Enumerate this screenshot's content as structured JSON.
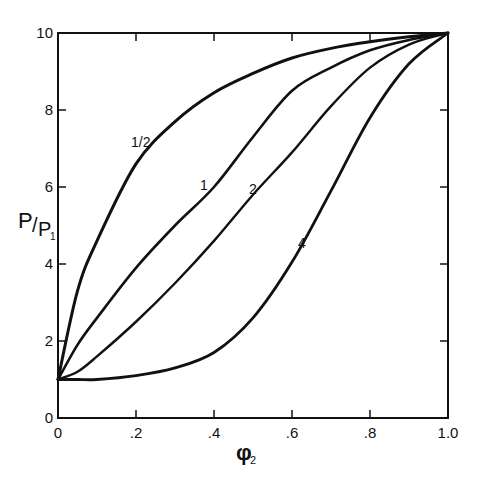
{
  "chart_data": {
    "type": "line",
    "title": "",
    "xlabel": "φ2",
    "ylabel": "P/P1",
    "xlim": [
      0,
      1.0
    ],
    "ylim": [
      0,
      10
    ],
    "grid": false,
    "legend": "inline curve labels",
    "x_ticks": [
      "0",
      ".2",
      ".4",
      ".6",
      ".8",
      "1.0"
    ],
    "y_ticks": [
      "0",
      "2",
      "4",
      "6",
      "8",
      "10"
    ],
    "x": [
      0,
      0.05,
      0.1,
      0.2,
      0.3,
      0.4,
      0.5,
      0.6,
      0.7,
      0.8,
      0.9,
      1.0
    ],
    "series": [
      {
        "name": "1/2",
        "label": "1/2",
        "values": [
          1.0,
          3.3,
          4.6,
          6.6,
          7.7,
          8.45,
          8.95,
          9.35,
          9.6,
          9.77,
          9.9,
          10.0
        ]
      },
      {
        "name": "1",
        "label": "1",
        "values": [
          1.0,
          1.9,
          2.6,
          3.9,
          5.0,
          6.0,
          7.3,
          8.5,
          9.1,
          9.55,
          9.82,
          10.0
        ]
      },
      {
        "name": "2",
        "label": "2",
        "values": [
          1.0,
          1.2,
          1.6,
          2.5,
          3.5,
          4.6,
          5.8,
          6.9,
          8.1,
          9.1,
          9.7,
          10.0
        ]
      },
      {
        "name": "4",
        "label": "4",
        "values": [
          1.0,
          1.0,
          1.0,
          1.1,
          1.3,
          1.7,
          2.6,
          4.05,
          5.9,
          7.8,
          9.2,
          10.0
        ]
      }
    ]
  },
  "axes": {
    "ylabel_main": "P",
    "ylabel_slash": "/",
    "ylabel_sub_main": "P",
    "ylabel_sub": "1",
    "xlabel_main": "φ",
    "xlabel_sub": "2"
  }
}
